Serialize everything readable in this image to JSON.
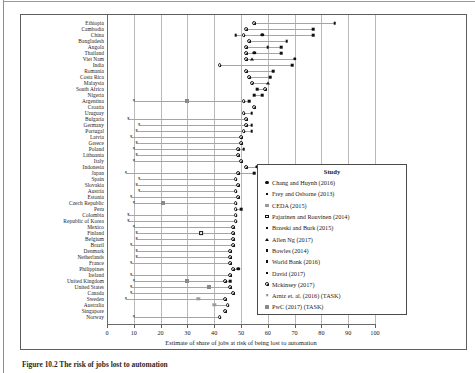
{
  "figure": {
    "caption": "Figure 10.2  The risk of jobs lost to automation"
  },
  "axis": {
    "x_title": "Estimate of share of jobs at risk of being lost to automation",
    "x_ticks": [
      0,
      10,
      20,
      30,
      40,
      50,
      60,
      70,
      80,
      90,
      100
    ],
    "xlim": [
      0,
      100
    ]
  },
  "legend": {
    "title": "Study",
    "items": [
      {
        "label": "Chang and Huynh (2016)",
        "marker": "filled-circle"
      },
      {
        "label": "Frey and Osborne (2013)",
        "marker": "small-square"
      },
      {
        "label": "CEDA (2015)",
        "marker": "grey-square"
      },
      {
        "label": "Pajarinen and Rouvinen (2014)",
        "marker": "open-square"
      },
      {
        "label": "Brzeski and Burk (2015)",
        "marker": "small-square"
      },
      {
        "label": "Allen Ng (2017)",
        "marker": "triangle"
      },
      {
        "label": "Bowles (2014)",
        "marker": "small-square"
      },
      {
        "label": "World Bank (2016)",
        "marker": "small-square"
      },
      {
        "label": "David (2017)",
        "marker": "small-square"
      },
      {
        "label": "Mckinsey (2017)",
        "marker": "bullseye"
      },
      {
        "label": "Arntz et. al. (2016) (TASK)",
        "marker": "x"
      },
      {
        "label": "PwC (2017) (TASK)",
        "marker": "xbox"
      }
    ]
  },
  "chart_data": {
    "type": "scatter",
    "title": "",
    "xlabel": "Estimate of share of jobs at risk of being lost to automation",
    "ylabel": "",
    "xlim": [
      0,
      100
    ],
    "grid": true,
    "legend_position": "right-bottom",
    "categories": [
      "Ethiopia",
      "Cambodia",
      "China",
      "Bangladesh",
      "Angola",
      "Thailand",
      "Viet Nam",
      "India",
      "Romania",
      "Costa Rica",
      "Malaysia",
      "South Africa",
      "Nigeria",
      "Argentina",
      "Croatia",
      "Uruguay",
      "Bulgaria",
      "Germany",
      "Portugal",
      "Latvia",
      "Greece",
      "Poland",
      "Lithuania",
      "Italy",
      "Indonesia",
      "Japan",
      "Spain",
      "Slovakia",
      "Austria",
      "Estonia",
      "Czech Republic",
      "Peru",
      "Colombia",
      "Republic of Korea",
      "Mexico",
      "Finland",
      "Belgium",
      "Brazil",
      "Denmark",
      "Netherlands",
      "France",
      "Philippines",
      "Ireland",
      "United Kingdom",
      "United States",
      "Canada",
      "Sweden",
      "Australia",
      "Singapore",
      "Norway"
    ],
    "points": [
      {
        "country": "Ethiopia",
        "study": "World Bank (2016)",
        "value": 85
      },
      {
        "country": "Ethiopia",
        "study": "Mckinsey (2017)",
        "value": 55
      },
      {
        "country": "Cambodia",
        "study": "World Bank (2016)",
        "value": 77
      },
      {
        "country": "Cambodia",
        "study": "Mckinsey (2017)",
        "value": 52
      },
      {
        "country": "China",
        "study": "Chang and Huynh (2016)",
        "value": 58
      },
      {
        "country": "China",
        "study": "World Bank (2016)",
        "value": 77
      },
      {
        "country": "China",
        "study": "Mckinsey (2017)",
        "value": 51
      },
      {
        "country": "China",
        "study": "Frey and Osborne (2013)",
        "value": 48
      },
      {
        "country": "Bangladesh",
        "study": "World Bank (2016)",
        "value": 67
      },
      {
        "country": "Bangladesh",
        "study": "Mckinsey (2017)",
        "value": 53
      },
      {
        "country": "Angola",
        "study": "World Bank (2016)",
        "value": 65
      },
      {
        "country": "Angola",
        "study": "Frey and Osborne (2013)",
        "value": 60
      },
      {
        "country": "Angola",
        "study": "Mckinsey (2017)",
        "value": 52
      },
      {
        "country": "Thailand",
        "study": "Chang and Huynh (2016)",
        "value": 55
      },
      {
        "country": "Thailand",
        "study": "World Bank (2016)",
        "value": 65
      },
      {
        "country": "Thailand",
        "study": "Mckinsey (2017)",
        "value": 52
      },
      {
        "country": "Viet Nam",
        "study": "Chang and Huynh (2016)",
        "value": 70
      },
      {
        "country": "Viet Nam",
        "study": "Allen Ng (2017)",
        "value": 54
      },
      {
        "country": "Viet Nam",
        "study": "Mckinsey (2017)",
        "value": 52
      },
      {
        "country": "India",
        "study": "World Bank (2016)",
        "value": 69
      },
      {
        "country": "India",
        "study": "Mckinsey (2017)",
        "value": 42
      },
      {
        "country": "Romania",
        "study": "Mckinsey (2017)",
        "value": 52
      },
      {
        "country": "Romania",
        "study": "Frey and Osborne (2013)",
        "value": 62
      },
      {
        "country": "Costa Rica",
        "study": "Mckinsey (2017)",
        "value": 53
      },
      {
        "country": "Costa Rica",
        "study": "Frey and Osborne (2013)",
        "value": 61
      },
      {
        "country": "Malaysia",
        "study": "Mckinsey (2017)",
        "value": 54
      },
      {
        "country": "Malaysia",
        "study": "Allen Ng (2017)",
        "value": 60
      },
      {
        "country": "South Africa",
        "study": "Frey and Osborne (2013)",
        "value": 56
      },
      {
        "country": "South Africa",
        "study": "Mckinsey (2017)",
        "value": 59
      },
      {
        "country": "Nigeria",
        "study": "Frey and Osborne (2013)",
        "value": 55
      },
      {
        "country": "Nigeria",
        "study": "World Bank (2016)",
        "value": 58
      },
      {
        "country": "Argentina",
        "study": "Arntz et. al. (2016) (TASK)",
        "value": 10
      },
      {
        "country": "Argentina",
        "study": "PwC (2017) (TASK)",
        "value": 30
      },
      {
        "country": "Argentina",
        "study": "Mckinsey (2017)",
        "value": 51
      },
      {
        "country": "Argentina",
        "study": "Frey and Osborne (2013)",
        "value": 53
      },
      {
        "country": "Croatia",
        "study": "Mckinsey (2017)",
        "value": 55
      },
      {
        "country": "Uruguay",
        "study": "Mckinsey (2017)",
        "value": 51
      },
      {
        "country": "Uruguay",
        "study": "Frey and Osborne (2013)",
        "value": 54
      },
      {
        "country": "Bulgaria",
        "study": "Arntz et. al. (2016) (TASK)",
        "value": 8
      },
      {
        "country": "Bulgaria",
        "study": "Mckinsey (2017)",
        "value": 52
      },
      {
        "country": "Germany",
        "study": "Arntz et. al. (2016) (TASK)",
        "value": 12
      },
      {
        "country": "Germany",
        "study": "Mckinsey (2017)",
        "value": 52
      },
      {
        "country": "Germany",
        "study": "Brzeski and Burk (2015)",
        "value": 54
      },
      {
        "country": "Portugal",
        "study": "Arntz et. al. (2016) (TASK)",
        "value": 11
      },
      {
        "country": "Portugal",
        "study": "Mckinsey (2017)",
        "value": 51
      },
      {
        "country": "Portugal",
        "study": "Frey and Osborne (2013)",
        "value": 54
      },
      {
        "country": "Latvia",
        "study": "Arntz et. al. (2016) (TASK)",
        "value": 9
      },
      {
        "country": "Latvia",
        "study": "Mckinsey (2017)",
        "value": 50
      },
      {
        "country": "Greece",
        "study": "Arntz et. al. (2016) (TASK)",
        "value": 11
      },
      {
        "country": "Greece",
        "study": "Mckinsey (2017)",
        "value": 50
      },
      {
        "country": "Poland",
        "study": "Arntz et. al. (2016) (TASK)",
        "value": 10
      },
      {
        "country": "Poland",
        "study": "Mckinsey (2017)",
        "value": 49
      },
      {
        "country": "Poland",
        "study": "Frey and Osborne (2013)",
        "value": 51
      },
      {
        "country": "Lithuania",
        "study": "Arntz et. al. (2016) (TASK)",
        "value": 11
      },
      {
        "country": "Lithuania",
        "study": "Mckinsey (2017)",
        "value": 49
      },
      {
        "country": "Italy",
        "study": "Arntz et. al. (2016) (TASK)",
        "value": 10
      },
      {
        "country": "Italy",
        "study": "Mckinsey (2017)",
        "value": 50
      },
      {
        "country": "Indonesia",
        "study": "Chang and Huynh (2016)",
        "value": 56
      },
      {
        "country": "Indonesia",
        "study": "Mckinsey (2017)",
        "value": 52
      },
      {
        "country": "Japan",
        "study": "Arntz et. al. (2016) (TASK)",
        "value": 7
      },
      {
        "country": "Japan",
        "study": "Mckinsey (2017)",
        "value": 49
      },
      {
        "country": "Japan",
        "study": "Frey and Osborne (2013)",
        "value": 55
      },
      {
        "country": "Spain",
        "study": "Arntz et. al. (2016) (TASK)",
        "value": 12
      },
      {
        "country": "Spain",
        "study": "Mckinsey (2017)",
        "value": 48
      },
      {
        "country": "Slovakia",
        "study": "Arntz et. al. (2016) (TASK)",
        "value": 11
      },
      {
        "country": "Slovakia",
        "study": "Mckinsey (2017)",
        "value": 49
      },
      {
        "country": "Austria",
        "study": "Arntz et. al. (2016) (TASK)",
        "value": 12
      },
      {
        "country": "Austria",
        "study": "Mckinsey (2017)",
        "value": 48
      },
      {
        "country": "Estonia",
        "study": "Arntz et. al. (2016) (TASK)",
        "value": 9
      },
      {
        "country": "Estonia",
        "study": "Mckinsey (2017)",
        "value": 49
      },
      {
        "country": "Czech Republic",
        "study": "Arntz et. al. (2016) (TASK)",
        "value": 10
      },
      {
        "country": "Czech Republic",
        "study": "PwC (2017) (TASK)",
        "value": 21
      },
      {
        "country": "Czech Republic",
        "study": "Mckinsey (2017)",
        "value": 48
      },
      {
        "country": "Peru",
        "study": "Mckinsey (2017)",
        "value": 48
      },
      {
        "country": "Peru",
        "study": "Frey and Osborne (2013)",
        "value": 50
      },
      {
        "country": "Colombia",
        "study": "Arntz et. al. (2016) (TASK)",
        "value": 8
      },
      {
        "country": "Colombia",
        "study": "Mckinsey (2017)",
        "value": 48
      },
      {
        "country": "Republic of Korea",
        "study": "Arntz et. al. (2016) (TASK)",
        "value": 8
      },
      {
        "country": "Republic of Korea",
        "study": "Mckinsey (2017)",
        "value": 48
      },
      {
        "country": "Mexico",
        "study": "Arntz et. al. (2016) (TASK)",
        "value": 10
      },
      {
        "country": "Mexico",
        "study": "Mckinsey (2017)",
        "value": 47
      },
      {
        "country": "Finland",
        "study": "Arntz et. al. (2016) (TASK)",
        "value": 11
      },
      {
        "country": "Finland",
        "study": "Mckinsey (2017)",
        "value": 47
      },
      {
        "country": "Finland",
        "study": "Pajarinen and Rouvinen (2014)",
        "value": 35
      },
      {
        "country": "Belgium",
        "study": "Arntz et. al. (2016) (TASK)",
        "value": 11
      },
      {
        "country": "Belgium",
        "study": "Mckinsey (2017)",
        "value": 47
      },
      {
        "country": "Brazil",
        "study": "Arntz et. al. (2016) (TASK)",
        "value": 9
      },
      {
        "country": "Brazil",
        "study": "Mckinsey (2017)",
        "value": 47
      },
      {
        "country": "Denmark",
        "study": "Arntz et. al. (2016) (TASK)",
        "value": 11
      },
      {
        "country": "Denmark",
        "study": "Mckinsey (2017)",
        "value": 46
      },
      {
        "country": "Netherlands",
        "study": "Arntz et. al. (2016) (TASK)",
        "value": 11
      },
      {
        "country": "Netherlands",
        "study": "Mckinsey (2017)",
        "value": 46
      },
      {
        "country": "France",
        "study": "Arntz et. al. (2016) (TASK)",
        "value": 9
      },
      {
        "country": "France",
        "study": "Mckinsey (2017)",
        "value": 46
      },
      {
        "country": "Philippines",
        "study": "Chang and Huynh (2016)",
        "value": 49
      },
      {
        "country": "Philippines",
        "study": "Mckinsey (2017)",
        "value": 47
      },
      {
        "country": "Ireland",
        "study": "Arntz et. al. (2016) (TASK)",
        "value": 9
      },
      {
        "country": "Ireland",
        "study": "Mckinsey (2017)",
        "value": 46
      },
      {
        "country": "United Kingdom",
        "study": "Arntz et. al. (2016) (TASK)",
        "value": 10
      },
      {
        "country": "United Kingdom",
        "study": "PwC (2017) (TASK)",
        "value": 30
      },
      {
        "country": "United Kingdom",
        "study": "Mckinsey (2017)",
        "value": 44
      },
      {
        "country": "United Kingdom",
        "study": "Frey and Osborne (2013)",
        "value": 46
      },
      {
        "country": "United States",
        "study": "Arntz et. al. (2016) (TASK)",
        "value": 9
      },
      {
        "country": "United States",
        "study": "PwC (2017) (TASK)",
        "value": 38
      },
      {
        "country": "United States",
        "study": "Mckinsey (2017)",
        "value": 46
      },
      {
        "country": "Canada",
        "study": "Arntz et. al. (2016) (TASK)",
        "value": 9
      },
      {
        "country": "Canada",
        "study": "Mckinsey (2017)",
        "value": 47
      },
      {
        "country": "Sweden",
        "study": "Arntz et. al. (2016) (TASK)",
        "value": 7
      },
      {
        "country": "Sweden",
        "study": "CEDA (2015)",
        "value": 34
      },
      {
        "country": "Sweden",
        "study": "Mckinsey (2017)",
        "value": 44
      },
      {
        "country": "Australia",
        "study": "Mckinsey (2017)",
        "value": 45
      },
      {
        "country": "Australia",
        "study": "CEDA (2015)",
        "value": 40
      },
      {
        "country": "Singapore",
        "study": "Mckinsey (2017)",
        "value": 44
      },
      {
        "country": "Norway",
        "study": "Arntz et. al. (2016) (TASK)",
        "value": 10
      },
      {
        "country": "Norway",
        "study": "Mckinsey (2017)",
        "value": 42
      }
    ]
  }
}
